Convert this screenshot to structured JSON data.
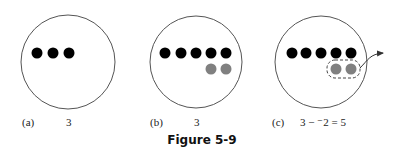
{
  "figure": {
    "caption": "Figure 5-9",
    "colors": {
      "positive": "#000000",
      "negative": "#808080",
      "outline": "#555555"
    },
    "panels": [
      {
        "id": "a",
        "label": "(a)",
        "expression": "3",
        "circle": {
          "cx": 68,
          "cy": 62,
          "r": 47
        },
        "positive_chips": [
          {
            "x": 37,
            "y": 53
          },
          {
            "x": 53,
            "y": 53
          },
          {
            "x": 69,
            "y": 53
          }
        ],
        "negative_chips": []
      },
      {
        "id": "b",
        "label": "(b)",
        "expression": "3",
        "circle": {
          "cx": 196,
          "cy": 62,
          "r": 46
        },
        "positive_chips": [
          {
            "x": 165,
            "y": 53
          },
          {
            "x": 181,
            "y": 53
          },
          {
            "x": 196,
            "y": 53
          },
          {
            "x": 211,
            "y": 53
          },
          {
            "x": 226,
            "y": 53
          }
        ],
        "negative_chips": [
          {
            "x": 211,
            "y": 69
          },
          {
            "x": 226,
            "y": 69
          }
        ]
      },
      {
        "id": "c",
        "label": "(c)",
        "expression": "3 − ⁻2 = 5",
        "circle": {
          "cx": 321,
          "cy": 62,
          "r": 46
        },
        "positive_chips": [
          {
            "x": 292,
            "y": 53
          },
          {
            "x": 306,
            "y": 53
          },
          {
            "x": 321,
            "y": 53
          },
          {
            "x": 336,
            "y": 53
          },
          {
            "x": 351,
            "y": 53
          }
        ],
        "negative_chips": [
          {
            "x": 336,
            "y": 69
          },
          {
            "x": 351,
            "y": 69
          }
        ],
        "removed_group": {
          "x": 327,
          "y": 60,
          "w": 33,
          "h": 18
        },
        "arrow": "remove-negatives"
      }
    ]
  }
}
